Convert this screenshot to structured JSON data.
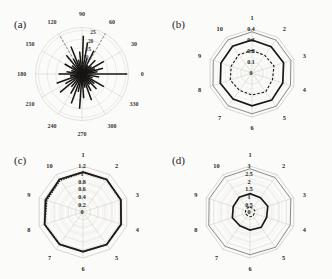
{
  "figure": {
    "background_color": "#fbfbf9",
    "panels": [
      {
        "tag": "(a)",
        "type": "polar-rose",
        "angular_labels": [
          "0",
          "30",
          "60",
          "90",
          "120",
          "150",
          "180",
          "210",
          "240",
          "270",
          "300",
          "330"
        ],
        "radial_labels": [
          "5",
          "10",
          "15",
          "20",
          "25"
        ]
      },
      {
        "tag": "(b)",
        "type": "radar",
        "angular_labels": [
          "1",
          "2",
          "3",
          "4",
          "5",
          "6",
          "7",
          "8",
          "9",
          "10"
        ],
        "radial_labels": [
          "0",
          "0.1",
          "0.2",
          "0.3",
          "0.4"
        ]
      },
      {
        "tag": "(c)",
        "type": "radar",
        "angular_labels": [
          "1",
          "2",
          "3",
          "4",
          "5",
          "6",
          "7",
          "8",
          "9",
          "10"
        ],
        "radial_labels": [
          "0",
          "0.2",
          "0.4",
          "0.6",
          "0.8",
          "1",
          "1.2"
        ]
      },
      {
        "tag": "(d)",
        "type": "radar",
        "angular_labels": [
          "1",
          "2",
          "3",
          "4",
          "5",
          "6",
          "7",
          "8",
          "9",
          "10"
        ],
        "radial_labels": [
          "0",
          "0.5",
          "1",
          "1.5",
          "2",
          "2.5",
          "3"
        ]
      }
    ]
  },
  "chart_data": [
    {
      "type": "line",
      "subtype": "polar-rose-star",
      "title": "(a)",
      "xlabel": "Angle (degrees)",
      "ylabel": "Magnitude",
      "grid": true,
      "legend": "none",
      "angular_unit": "degrees",
      "angular_ticks": [
        0,
        30,
        60,
        90,
        120,
        150,
        180,
        210,
        240,
        270,
        300,
        330
      ],
      "radial_ticks": [
        5,
        10,
        15,
        20,
        25
      ],
      "rlim": [
        0,
        27
      ],
      "rays": [
        {
          "angle": 0,
          "length": 26.0
        },
        {
          "angle": 8,
          "length": 9.0
        },
        {
          "angle": 15,
          "length": 12.5
        },
        {
          "angle": 22,
          "length": 8.0
        },
        {
          "angle": 30,
          "length": 14.5
        },
        {
          "angle": 38,
          "length": 7.0
        },
        {
          "angle": 46,
          "length": 11.0
        },
        {
          "angle": 55,
          "length": 6.0
        },
        {
          "angle": 63,
          "length": 15.0
        },
        {
          "angle": 72,
          "length": 9.5
        },
        {
          "angle": 80,
          "length": 18.5
        },
        {
          "angle": 88,
          "length": 22.0
        },
        {
          "angle": 96,
          "length": 13.0
        },
        {
          "angle": 104,
          "length": 8.5
        },
        {
          "angle": 112,
          "length": 17.0
        },
        {
          "angle": 120,
          "length": 10.0
        },
        {
          "angle": 130,
          "length": 14.0
        },
        {
          "angle": 140,
          "length": 7.5
        },
        {
          "angle": 150,
          "length": 11.5
        },
        {
          "angle": 162,
          "length": 6.5
        },
        {
          "angle": 172,
          "length": 9.0
        },
        {
          "angle": 180,
          "length": 13.5
        },
        {
          "angle": 190,
          "length": 7.0
        },
        {
          "angle": 200,
          "length": 15.5
        },
        {
          "angle": 210,
          "length": 11.0
        },
        {
          "angle": 220,
          "length": 16.5
        },
        {
          "angle": 230,
          "length": 9.5
        },
        {
          "angle": 240,
          "length": 13.0
        },
        {
          "angle": 250,
          "length": 18.0
        },
        {
          "angle": 258,
          "length": 10.5
        },
        {
          "angle": 266,
          "length": 20.0
        },
        {
          "angle": 274,
          "length": 14.0
        },
        {
          "angle": 282,
          "length": 8.0
        },
        {
          "angle": 290,
          "length": 16.0
        },
        {
          "angle": 298,
          "length": 11.0
        },
        {
          "angle": 306,
          "length": 7.5
        },
        {
          "angle": 314,
          "length": 12.0
        },
        {
          "angle": 322,
          "length": 9.0
        },
        {
          "angle": 330,
          "length": 14.5
        },
        {
          "angle": 340,
          "length": 6.5
        },
        {
          "angle": 350,
          "length": 10.0
        }
      ],
      "guide_rays": [
        {
          "angle": 60,
          "length": 27.0,
          "style": "dashed"
        },
        {
          "angle": 120,
          "length": 26.0,
          "style": "dashed"
        }
      ]
    },
    {
      "type": "line",
      "subtype": "radar",
      "title": "(b)",
      "categories": [
        "1",
        "2",
        "3",
        "4",
        "5",
        "6",
        "7",
        "8",
        "9",
        "10"
      ],
      "radial_ticks": [
        0,
        0.1,
        0.2,
        0.3,
        0.4
      ],
      "rlim": [
        0,
        0.4
      ],
      "grid": true,
      "legend": "none",
      "series": [
        {
          "name": "outer-gray",
          "style": "thin-gray",
          "values": [
            0.375,
            0.37,
            0.372,
            0.368,
            0.374,
            0.371,
            0.369,
            0.373,
            0.37,
            0.372
          ]
        },
        {
          "name": "middle-black",
          "style": "thick-black",
          "values": [
            0.3,
            0.296,
            0.302,
            0.294,
            0.305,
            0.298,
            0.292,
            0.303,
            0.297,
            0.301
          ]
        },
        {
          "name": "inner-dashed",
          "style": "dashed-black",
          "values": [
            0.205,
            0.198,
            0.21,
            0.196,
            0.212,
            0.2,
            0.194,
            0.208,
            0.199,
            0.206
          ]
        }
      ]
    },
    {
      "type": "line",
      "subtype": "radar",
      "title": "(c)",
      "categories": [
        "1",
        "2",
        "3",
        "4",
        "5",
        "6",
        "7",
        "8",
        "9",
        "10"
      ],
      "radial_ticks": [
        0,
        0.2,
        0.4,
        0.6,
        0.8,
        1,
        1.2
      ],
      "rlim": [
        0,
        1.2
      ],
      "grid": true,
      "legend": "none",
      "series": [
        {
          "name": "outer-gray",
          "style": "thin-gray",
          "values": [
            1.055,
            1.06,
            1.05,
            1.058,
            1.062,
            1.048,
            1.056,
            1.064,
            1.052,
            1.059
          ]
        },
        {
          "name": "solid-black",
          "style": "thick-black",
          "values": [
            1.04,
            1.048,
            1.036,
            1.044,
            1.05,
            1.034,
            1.042,
            1.052,
            1.02,
            1.046
          ]
        },
        {
          "name": "dotted-black",
          "style": "dotted-black",
          "values": [
            1.03,
            1.042,
            1.03,
            1.04,
            1.046,
            1.03,
            1.038,
            1.048,
            0.99,
            1.018
          ]
        }
      ]
    },
    {
      "type": "line",
      "subtype": "radar",
      "title": "(d)",
      "categories": [
        "1",
        "2",
        "3",
        "4",
        "5",
        "6",
        "7",
        "8",
        "9",
        "10"
      ],
      "radial_ticks": [
        0,
        0.5,
        1,
        1.5,
        2,
        2.5,
        3
      ],
      "rlim": [
        0,
        3
      ],
      "grid": true,
      "legend": "none",
      "series": [
        {
          "name": "outer-gray",
          "style": "thin-gray",
          "values": [
            2.82,
            2.78,
            2.8,
            2.76,
            2.84,
            2.79,
            2.77,
            2.83,
            2.8,
            2.81
          ]
        },
        {
          "name": "middle-black",
          "style": "thick-black",
          "values": [
            1.2,
            1.16,
            1.22,
            1.14,
            1.24,
            1.18,
            1.12,
            1.21,
            1.15,
            1.19
          ]
        },
        {
          "name": "inner-dashed",
          "style": "dashed-black",
          "values": [
            0.32,
            0.3,
            0.33,
            0.29,
            0.34,
            0.31,
            0.28,
            0.33,
            0.3,
            0.32
          ]
        }
      ]
    }
  ]
}
